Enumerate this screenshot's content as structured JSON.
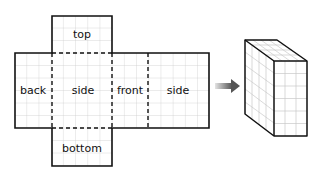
{
  "net": {
    "faces": {
      "top": "top",
      "back": "back",
      "side_left": "side",
      "front": "front",
      "side_right": "side",
      "bottom": "bottom"
    },
    "grid_cell_px": 12.2
  },
  "arrow": {
    "direction": "right",
    "color": "#888888"
  },
  "solid": {
    "type": "rectangular prism",
    "grid_faces": true
  },
  "colors": {
    "line": "#111111",
    "grid": "#c8c8c8",
    "arrow_start": "#dddddd",
    "arrow_end": "#666666"
  }
}
